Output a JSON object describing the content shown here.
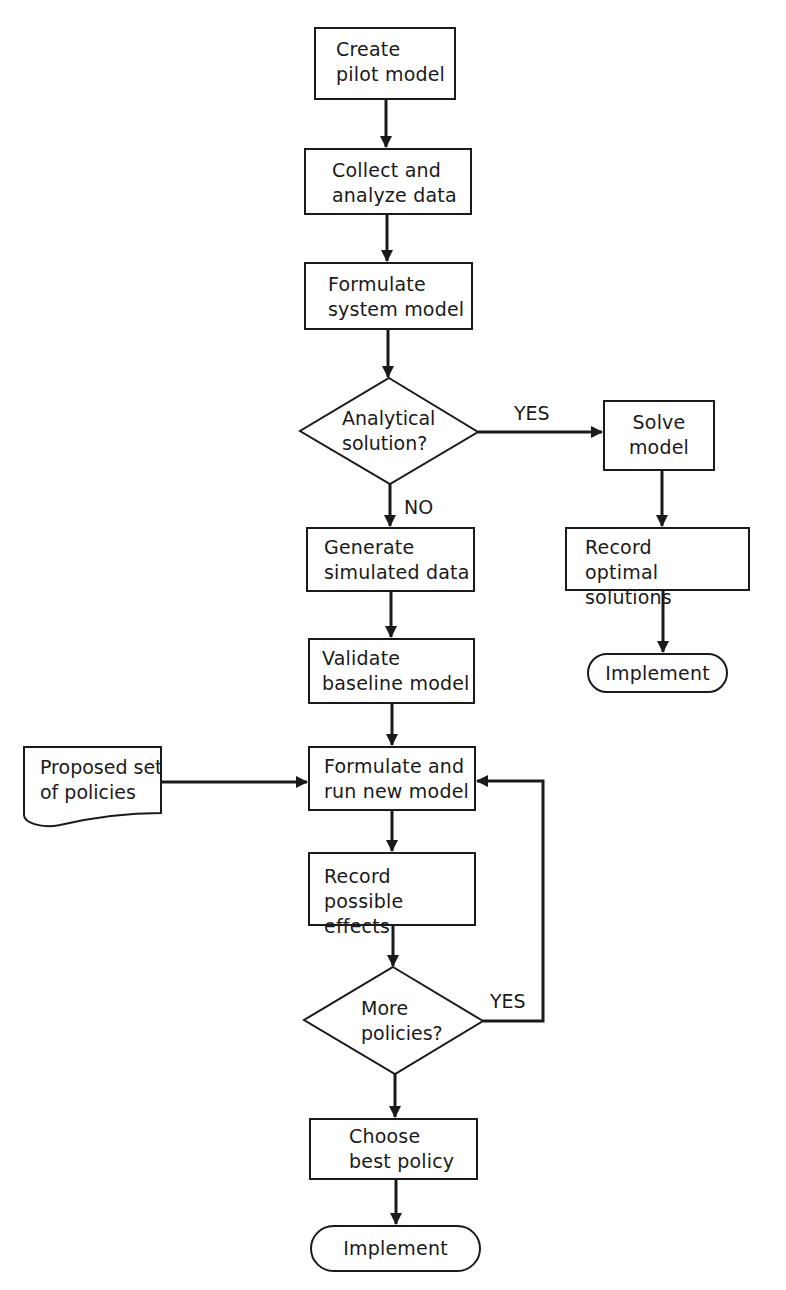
{
  "flowchart": {
    "nodes": {
      "create_pilot": {
        "line1": "Create",
        "line2": "pilot model"
      },
      "collect": {
        "line1": "Collect and",
        "line2": "analyze data"
      },
      "formulate_system": {
        "line1": "Formulate",
        "line2": "system model"
      },
      "decision_analytical": {
        "line1": "Analytical",
        "line2": "solution?"
      },
      "solve": {
        "line1": "Solve",
        "line2": "model"
      },
      "record_optimal": {
        "line1": "Record",
        "line2": "optimal solutions"
      },
      "implement_right": {
        "label": "Implement"
      },
      "generate": {
        "line1": "Generate",
        "line2": "simulated data"
      },
      "validate": {
        "line1": "Validate",
        "line2": "baseline model"
      },
      "proposed": {
        "line1": "Proposed set",
        "line2": "of policies"
      },
      "formulate_run": {
        "line1": "Formulate and",
        "line2": "run new model"
      },
      "record_effects": {
        "line1": "Record",
        "line2": "possible effects"
      },
      "decision_more": {
        "line1": "More",
        "line2": "policies?"
      },
      "choose": {
        "line1": "Choose",
        "line2": "best policy"
      },
      "implement_bottom": {
        "label": "Implement"
      }
    },
    "edge_labels": {
      "analytical_yes": "YES",
      "analytical_no": "NO",
      "more_yes": "YES"
    },
    "colors": {
      "stroke": "#1a1a1a",
      "background": "#ffffff"
    }
  }
}
